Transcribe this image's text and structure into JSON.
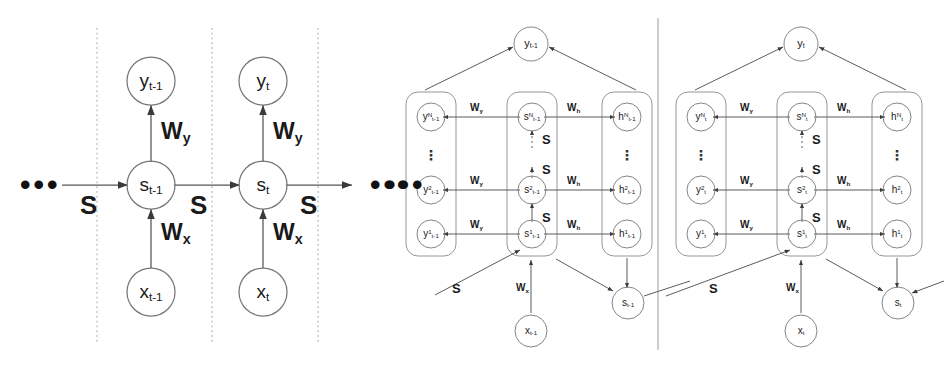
{
  "figure": {
    "ink_color": "#3a3a3a",
    "text_color": "#1a1a1a",
    "background": "#ffffff"
  },
  "left_diagram": {
    "name": "simple-rnn-unrolled",
    "ellipsis_left": "•••",
    "ellipsis_right": "•••",
    "timesteps": [
      {
        "id": "t-1",
        "output_node": {
          "base": "y",
          "sub": "t-1"
        },
        "state_node": {
          "base": "s",
          "sub": "t-1"
        },
        "input_node": {
          "base": "x",
          "sub": "t-1"
        },
        "weight_output": {
          "base": "W",
          "sub": "y"
        },
        "weight_input": {
          "base": "W",
          "sub": "x"
        },
        "recurrent_label": "S"
      },
      {
        "id": "t",
        "output_node": {
          "base": "y",
          "sub": "t"
        },
        "state_node": {
          "base": "s",
          "sub": "t"
        },
        "input_node": {
          "base": "x",
          "sub": "t"
        },
        "weight_output": {
          "base": "W",
          "sub": "y"
        },
        "weight_input": {
          "base": "W",
          "sub": "x"
        },
        "recurrent_label": "S"
      }
    ],
    "recurrent_labels": [
      "S",
      "S",
      "S"
    ]
  },
  "right_diagram": {
    "name": "deep-stacked-rnn-unrolled",
    "ellipsis_left": "•••",
    "column_headers": {
      "y_column": "y",
      "s_column": "s",
      "h_column": "h"
    },
    "timesteps": [
      {
        "id": "t-1",
        "aggregate_output": {
          "base": "y",
          "sub": "t-1"
        },
        "aggregate_state": {
          "base": "s",
          "sub": "t-1"
        },
        "input_node": {
          "base": "x",
          "sub": "t-1"
        },
        "weight_input": {
          "base": "W",
          "sub": "x"
        },
        "skip_label": "S",
        "layers": [
          {
            "level": "N",
            "y": {
              "base": "y",
              "sup": "N",
              "sub": "t-1"
            },
            "s": {
              "base": "s",
              "sup": "N",
              "sub": "t-1"
            },
            "h": {
              "base": "h",
              "sup": "N",
              "sub": "t-1"
            },
            "w_y": {
              "base": "W",
              "sub": "y"
            },
            "w_h": {
              "base": "W",
              "sub": "h"
            }
          },
          {
            "level": "2",
            "y": {
              "base": "y",
              "sup": "2",
              "sub": "t-1"
            },
            "s": {
              "base": "s",
              "sup": "2",
              "sub": "t-1"
            },
            "h": {
              "base": "h",
              "sup": "2",
              "sub": "t-1"
            },
            "w_y": {
              "base": "W",
              "sub": "y"
            },
            "w_h": {
              "base": "W",
              "sub": "h"
            }
          },
          {
            "level": "1",
            "y": {
              "base": "y",
              "sup": "1",
              "sub": "t-1"
            },
            "s": {
              "base": "s",
              "sup": "1",
              "sub": "t-1"
            },
            "h": {
              "base": "h",
              "sup": "1",
              "sub": "t-1"
            },
            "w_y": {
              "base": "W",
              "sub": "y"
            },
            "w_h": {
              "base": "W",
              "sub": "h"
            }
          }
        ],
        "stack_labels": [
          "S",
          "S",
          "S"
        ],
        "vertical_ellipsis": "⋮"
      },
      {
        "id": "t",
        "aggregate_output": {
          "base": "y",
          "sub": "t"
        },
        "aggregate_state": {
          "base": "s",
          "sub": "t"
        },
        "input_node": {
          "base": "x",
          "sub": "t"
        },
        "weight_input": {
          "base": "W",
          "sub": "x"
        },
        "skip_label": "S",
        "layers": [
          {
            "level": "N",
            "y": {
              "base": "y",
              "sup": "N",
              "sub": "t"
            },
            "s": {
              "base": "s",
              "sup": "N",
              "sub": "t"
            },
            "h": {
              "base": "h",
              "sup": "N",
              "sub": "t"
            },
            "w_y": {
              "base": "W",
              "sub": "y"
            },
            "w_h": {
              "base": "W",
              "sub": "h"
            }
          },
          {
            "level": "2",
            "y": {
              "base": "y",
              "sup": "2",
              "sub": "t"
            },
            "s": {
              "base": "s",
              "sup": "2",
              "sub": "t"
            },
            "h": {
              "base": "h",
              "sup": "2",
              "sub": "t"
            },
            "w_y": {
              "base": "W",
              "sub": "y"
            },
            "w_h": {
              "base": "W",
              "sub": "h"
            }
          },
          {
            "level": "1",
            "y": {
              "base": "y",
              "sup": "1",
              "sub": "t"
            },
            "s": {
              "base": "s",
              "sup": "1",
              "sub": "t"
            },
            "h": {
              "base": "h",
              "sup": "1",
              "sub": "t"
            },
            "w_y": {
              "base": "W",
              "sub": "y"
            },
            "w_h": {
              "base": "W",
              "sub": "h"
            }
          }
        ],
        "stack_labels": [
          "S",
          "S",
          "S"
        ],
        "vertical_ellipsis": "⋮"
      }
    ]
  }
}
